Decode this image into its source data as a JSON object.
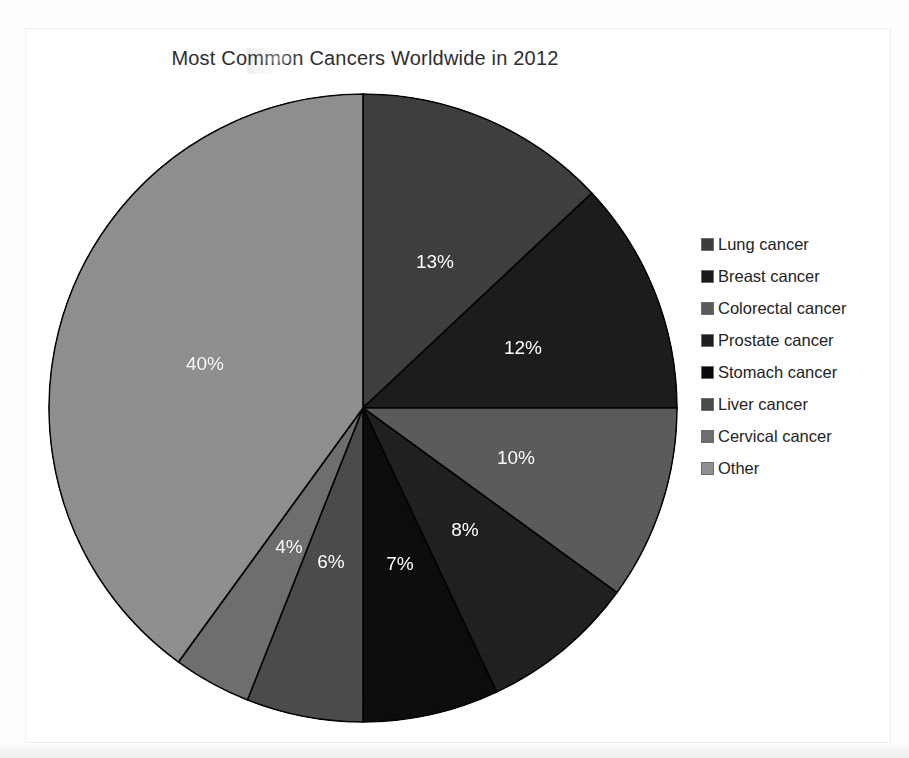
{
  "chart_data": {
    "type": "pie",
    "title": "Most Common Cancers Worldwide in 2012",
    "categories": [
      "Lung cancer",
      "Breast cancer",
      "Colorectal cancer",
      "Prostate cancer",
      "Stomach cancer",
      "Liver cancer",
      "Cervical cancer",
      "Other"
    ],
    "values": [
      13,
      12,
      10,
      8,
      7,
      6,
      4,
      40
    ],
    "value_labels": [
      "13%",
      "12%",
      "10%",
      "8%",
      "7%",
      "6%",
      "4%",
      "40%"
    ],
    "unit": "percent",
    "total": 100,
    "start_angle_deg": 0,
    "direction": "clockwise",
    "legend_position": "right",
    "grid": false,
    "xlabel": "",
    "ylabel": "",
    "slice_colors": [
      "#3d3d3d",
      "#1a1a1a",
      "#5a5a5a",
      "#1e1e1e",
      "#0a0a0a",
      "#4a4a4a",
      "#6e6e6e",
      "#8f8f8f"
    ],
    "label_text_color": "#ffffff",
    "slice_border_color": "#000000",
    "background_color": "#ffffff"
  },
  "chart": {
    "title": "Most Common Cancers Worldwide in 2012",
    "slices": [
      {
        "label": "Lung cancer",
        "percent_label": "13%",
        "value": 13,
        "color": "#3d3d3d",
        "label_x": 435,
        "label_y": 262
      },
      {
        "label": "Breast cancer",
        "percent_label": "12%",
        "value": 12,
        "color": "#1a1a1a",
        "label_x": 523,
        "label_y": 348
      },
      {
        "label": "Colorectal cancer",
        "percent_label": "10%",
        "value": 10,
        "color": "#5a5a5a",
        "label_x": 516,
        "label_y": 458
      },
      {
        "label": "Prostate cancer",
        "percent_label": "8%",
        "value": 8,
        "color": "#1e1e1e",
        "label_x": 465,
        "label_y": 530
      },
      {
        "label": "Stomach cancer",
        "percent_label": "7%",
        "value": 7,
        "color": "#0a0a0a",
        "label_x": 400,
        "label_y": 564
      },
      {
        "label": "Liver cancer",
        "percent_label": "6%",
        "value": 6,
        "color": "#4a4a4a",
        "label_x": 331,
        "label_y": 562
      },
      {
        "label": "Cervical cancer",
        "percent_label": "4%",
        "value": 4,
        "color": "#6e6e6e",
        "label_x": 289,
        "label_y": 547
      },
      {
        "label": "Other",
        "percent_label": "40%",
        "value": 40,
        "color": "#8f8f8f",
        "label_x": 205,
        "label_y": 364
      }
    ]
  },
  "legend": {
    "items": [
      {
        "label": "Lung cancer",
        "color": "#3d3d3d"
      },
      {
        "label": "Breast cancer",
        "color": "#1a1a1a"
      },
      {
        "label": "Colorectal cancer",
        "color": "#5a5a5a"
      },
      {
        "label": "Prostate cancer",
        "color": "#1e1e1e"
      },
      {
        "label": "Stomach cancer",
        "color": "#0a0a0a"
      },
      {
        "label": "Liver cancer",
        "color": "#4a4a4a"
      },
      {
        "label": "Cervical cancer",
        "color": "#6e6e6e"
      },
      {
        "label": "Other",
        "color": "#8f8f8f"
      }
    ]
  }
}
